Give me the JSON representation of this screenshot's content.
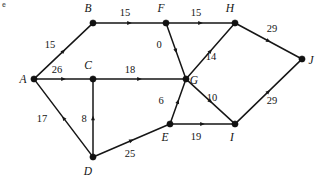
{
  "figure": {
    "corner_mark": "e",
    "width": 321,
    "height": 183
  },
  "chart_data": {
    "type": "diagram",
    "diagram_kind": "directed-weighted-graph",
    "title": "",
    "background_color": "#ffffff",
    "node_color": "#111111",
    "edge_color": "#161616",
    "nodes": [
      {
        "id": "A",
        "label": "A",
        "x": 34,
        "y": 79,
        "label_x": 23,
        "label_y": 83
      },
      {
        "id": "B",
        "label": "B",
        "x": 93,
        "y": 23,
        "label_x": 88,
        "label_y": 12
      },
      {
        "id": "C",
        "label": "C",
        "x": 93,
        "y": 79,
        "label_x": 88,
        "label_y": 69
      },
      {
        "id": "D",
        "label": "D",
        "x": 93,
        "y": 157,
        "label_x": 88,
        "label_y": 175
      },
      {
        "id": "E",
        "label": "E",
        "x": 170,
        "y": 124,
        "label_x": 165,
        "label_y": 141
      },
      {
        "id": "F",
        "label": "F",
        "x": 166,
        "y": 23,
        "label_x": 161,
        "label_y": 12
      },
      {
        "id": "G",
        "label": "G",
        "x": 186,
        "y": 79,
        "label_x": 194,
        "label_y": 84
      },
      {
        "id": "H",
        "label": "H",
        "x": 235,
        "y": 23,
        "label_x": 230,
        "label_y": 12
      },
      {
        "id": "I",
        "label": "I",
        "x": 235,
        "y": 124,
        "label_x": 232,
        "label_y": 141
      },
      {
        "id": "J",
        "label": "J",
        "x": 302,
        "y": 59,
        "label_x": 311,
        "label_y": 64
      }
    ],
    "edges": [
      {
        "from": "A",
        "to": "B",
        "weight": 15,
        "directed": true,
        "label_x": 50,
        "label_y": 48
      },
      {
        "from": "B",
        "to": "F",
        "weight": 15,
        "directed": true,
        "label_x": 125,
        "label_y": 16
      },
      {
        "from": "F",
        "to": "H",
        "weight": 15,
        "directed": true,
        "label_x": 196,
        "label_y": 16
      },
      {
        "from": "H",
        "to": "J",
        "weight": 29,
        "directed": true,
        "label_x": 272,
        "label_y": 32
      },
      {
        "from": "F",
        "to": "G",
        "weight": 0,
        "directed": true,
        "label_x": 159,
        "label_y": 48
      },
      {
        "from": "G",
        "to": "H",
        "weight": 14,
        "directed": true,
        "label_x": 211,
        "label_y": 60
      },
      {
        "from": "G",
        "to": "I",
        "weight": 10,
        "directed": true,
        "label_x": 212,
        "label_y": 101
      },
      {
        "from": "A",
        "to": "C",
        "weight": 26,
        "directed": true,
        "label_x": 57,
        "label_y": 73
      },
      {
        "from": "C",
        "to": "G",
        "weight": 18,
        "directed": true,
        "label_x": 130,
        "label_y": 73
      },
      {
        "from": "D",
        "to": "A",
        "weight": 17,
        "directed": true,
        "label_x": 42,
        "label_y": 122
      },
      {
        "from": "D",
        "to": "C",
        "weight": 8,
        "directed": true,
        "label_x": 84,
        "label_y": 122
      },
      {
        "from": "D",
        "to": "E",
        "weight": 25,
        "directed": true,
        "label_x": 130,
        "label_y": 157
      },
      {
        "from": "E",
        "to": "G",
        "weight": 6,
        "directed": true,
        "label_x": 161,
        "label_y": 104
      },
      {
        "from": "E",
        "to": "I",
        "weight": 19,
        "directed": true,
        "label_x": 196,
        "label_y": 140
      },
      {
        "from": "I",
        "to": "J",
        "weight": 29,
        "directed": true,
        "label_x": 272,
        "label_y": 104
      }
    ],
    "node_count": 10,
    "edge_count": 15
  }
}
